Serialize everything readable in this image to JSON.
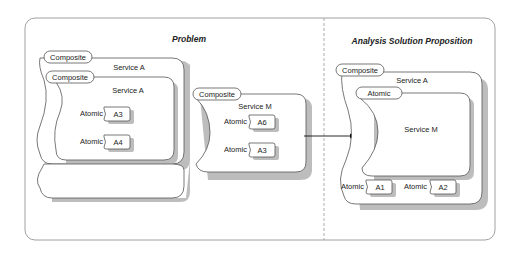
{
  "panels": {
    "problem": {
      "title": "Problem",
      "outer_service": {
        "tag": "Composite",
        "name": "Service A"
      },
      "inner_service": {
        "tag": "Composite",
        "name": "Service A",
        "atomics": [
          {
            "tag": "Atomic",
            "name": "A3"
          },
          {
            "tag": "Atomic",
            "name": "A4"
          }
        ]
      },
      "outer_atomics": [
        {
          "tag": "Atomic",
          "name": "A1"
        },
        {
          "tag": "Atomic",
          "name": "A2"
        }
      ],
      "service_m": {
        "tag": "Composite",
        "name": "Service M",
        "atomics": [
          {
            "tag": "Atomic",
            "name": "A6"
          },
          {
            "tag": "Atomic",
            "name": "A3"
          }
        ]
      }
    },
    "solution": {
      "title": "Analysis Solution Proposition",
      "outer_service": {
        "tag": "Composite",
        "name": "Service A"
      },
      "inner_service": {
        "tag": "Atomic",
        "name": "Service M"
      },
      "atomics": [
        {
          "tag": "Atomic",
          "name": "A1"
        },
        {
          "tag": "Atomic",
          "name": "A2"
        }
      ]
    }
  },
  "colors": {
    "stroke": "#555555",
    "shadow": "#bdbdbd",
    "frame": "#888888"
  }
}
